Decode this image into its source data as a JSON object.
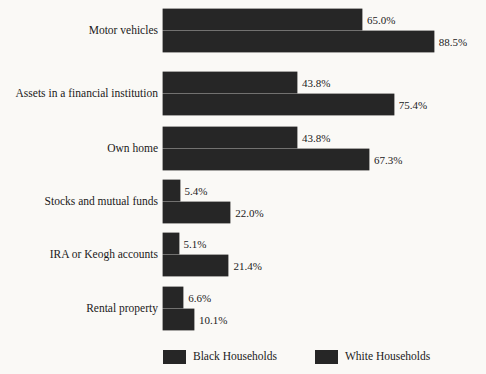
{
  "chart_data": {
    "type": "bar",
    "orientation": "horizontal",
    "title": "",
    "subtitle": "",
    "xlabel": "",
    "ylabel": "",
    "xlim": [
      0,
      88.5
    ],
    "grid": false,
    "legend_position": "bottom",
    "value_suffix": "%",
    "categories": [
      "Motor vehicles",
      "Assets in a financial institution",
      "Own home",
      "Stocks and mutual funds",
      "IRA or Keogh accounts",
      "Rental property"
    ],
    "series": [
      {
        "name": "Black Households",
        "color": "#262626",
        "values": [
          65.0,
          43.8,
          43.8,
          5.4,
          5.1,
          6.6
        ],
        "labels": [
          "65.0%",
          "43.8%",
          "43.8%",
          "5.4%",
          "5.1%",
          "6.6%"
        ]
      },
      {
        "name": "White Households",
        "color": "#262626",
        "values": [
          88.5,
          75.4,
          67.3,
          22.0,
          21.4,
          10.1
        ],
        "labels": [
          "88.5%",
          "75.4%",
          "67.3%",
          "22.0%",
          "21.4%",
          "10.1%"
        ]
      }
    ],
    "legend": [
      {
        "label": "Black Households",
        "color": "#262626"
      },
      {
        "label": "White Households",
        "color": "#262626"
      }
    ]
  },
  "colors": {
    "background": "#faf9f6",
    "bar": "#262626",
    "text": "#1a1a1a"
  }
}
